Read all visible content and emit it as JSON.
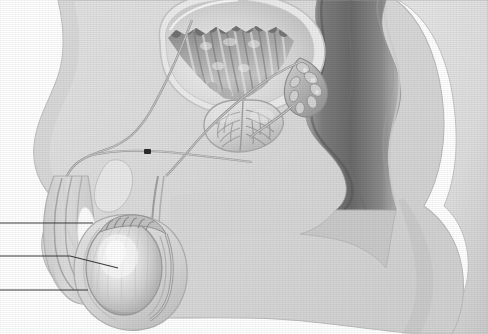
{
  "figure": {
    "view": "sagittal section, left lateral",
    "style": "grayscale medical line-and-wash illustration with halftone scan-line texture",
    "background_color": "#ffffff",
    "body_fill_color": "#dcdcdc",
    "body_outline_color": "#b9b9b9",
    "organ_light_color": "#e8e8e8",
    "organ_mid_color": "#c2c2c2",
    "organ_dark_color": "#8f8f8f",
    "rectum_dark_color": "#6f6f6f",
    "highlight_color": "#fdfdfd",
    "leader_line_color": "#3a3a3a",
    "marker_color": "#2b2b2b"
  },
  "structures": [
    {
      "id": "body-contour",
      "name": "Body wall / pelvic soft tissue",
      "tone": "#dcdcdc"
    },
    {
      "id": "bladder",
      "name": "Urinary bladder",
      "tone": "#cfcfcf"
    },
    {
      "id": "bladder-rugae",
      "name": "Bladder mucosal rugae",
      "tone": "#9a9a9a"
    },
    {
      "id": "prostate",
      "name": "Prostate gland",
      "tone": "#d6d6d6"
    },
    {
      "id": "prostate-ducts",
      "name": "Prostatic ducts",
      "tone": "#a8a8a8"
    },
    {
      "id": "seminal-vesicle",
      "name": "Seminal vesicle",
      "tone": "#b5b5b5"
    },
    {
      "id": "ejaculatory-duct",
      "name": "Ejaculatory duct",
      "tone": "#9f9f9f"
    },
    {
      "id": "rectum",
      "name": "Rectum",
      "tone": "#6f6f6f"
    },
    {
      "id": "pubic-bone",
      "name": "Pubic symphysis",
      "tone": "#e3e3e3"
    },
    {
      "id": "vas-deferens",
      "name": "Vas deferens (ductus deferens)",
      "tone": "#8d8d8d"
    },
    {
      "id": "penis-shaft",
      "name": "Penile shaft",
      "tone": "#d8d8d8"
    },
    {
      "id": "corpus-cavernosum",
      "name": "Corpus cavernosum",
      "tone": "#d2d2d2"
    },
    {
      "id": "corpus-spongiosum",
      "name": "Corpus spongiosum / urethra",
      "tone": "#fdfdfd"
    },
    {
      "id": "testis",
      "name": "Testis",
      "tone": "#d0d0d0"
    },
    {
      "id": "epididymis",
      "name": "Epididymis",
      "tone": "#bdbdbd"
    },
    {
      "id": "scrotum",
      "name": "Scrotum",
      "tone": "#d9d9d9"
    },
    {
      "id": "thigh",
      "name": "Thigh / gluteal mass",
      "tone": "#e0e0e0"
    }
  ],
  "leader_lines": [
    {
      "id": "leader-1",
      "label": "",
      "x1": 0,
      "y1": 223,
      "x2": 93,
      "y2": 223,
      "points_to": "epididymis"
    },
    {
      "id": "leader-2",
      "label": "",
      "x1": 0,
      "y1": 256,
      "x2": 118,
      "y2": 268,
      "points_to": "testis"
    },
    {
      "id": "leader-3",
      "label": "",
      "x1": 0,
      "y1": 290,
      "x2": 88,
      "y2": 290,
      "points_to": "scrotum"
    }
  ],
  "markers": [
    {
      "id": "vas-marker",
      "name": "vas deferens marker",
      "x": 148,
      "y": 152,
      "width": 7,
      "height": 5
    }
  ]
}
